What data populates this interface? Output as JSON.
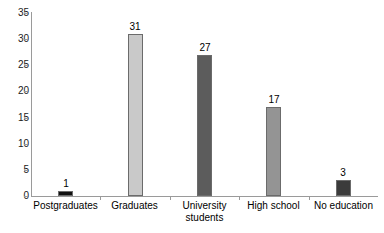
{
  "chart_data": {
    "type": "bar",
    "title": "",
    "subtitle": "",
    "xlabel": "",
    "ylabel": "",
    "categories": [
      "Postgraduates",
      "Graduates",
      "University\nstudents",
      "High school",
      "No education"
    ],
    "values": [
      1,
      31,
      27,
      17,
      3
    ],
    "ylim": [
      0,
      35
    ],
    "yticks": [
      0,
      5,
      10,
      15,
      20,
      25,
      30,
      35
    ],
    "ytick_labels": [
      "0",
      "5",
      "10",
      "15",
      "20",
      "25",
      "30",
      "35"
    ],
    "grid": false,
    "legend": false,
    "data_labels": [
      "1",
      "31",
      "27",
      "17",
      "3"
    ],
    "bar_colors": [
      "#111111",
      "#c9c9c9",
      "#5c5c5c",
      "#949494",
      "#3b3b3b"
    ],
    "bar_edge_color": "#6b6b6b",
    "axis_color": "#9a9a9a",
    "background": "#ffffff",
    "series": [
      {
        "name": "Count",
        "values": [
          1,
          31,
          27,
          17,
          3
        ]
      }
    ],
    "points": [
      {
        "category": "Postgraduates",
        "label_line1": "Postgraduates",
        "label_line2": "",
        "value": 1,
        "value_label": "1",
        "color": "#111111"
      },
      {
        "category": "Graduates",
        "label_line1": "Graduates",
        "label_line2": "",
        "value": 31,
        "value_label": "31",
        "color": "#c9c9c9"
      },
      {
        "category": "University students",
        "label_line1": "University",
        "label_line2": "students",
        "value": 27,
        "value_label": "27",
        "color": "#5c5c5c"
      },
      {
        "category": "High school",
        "label_line1": "High school",
        "label_line2": "",
        "value": 17,
        "value_label": "17",
        "color": "#949494"
      },
      {
        "category": "No education",
        "label_line1": "No education",
        "label_line2": "",
        "value": 3,
        "value_label": "3",
        "color": "#3b3b3b"
      }
    ]
  }
}
